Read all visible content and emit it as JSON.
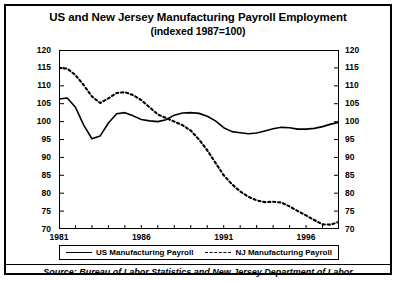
{
  "chart_data": {
    "type": "line",
    "title": "US and New Jersey Manufacturing Payroll Employment",
    "subtitle": "(indexed 1987=100)",
    "xlabel": "",
    "ylabel": "",
    "ylim": [
      70,
      120
    ],
    "ytick_step": 5,
    "yticks": [
      70,
      75,
      80,
      85,
      90,
      95,
      100,
      105,
      110,
      115,
      120
    ],
    "xlim": [
      1981,
      1998
    ],
    "xticks_labeled": [
      1981,
      1986,
      1991,
      1996
    ],
    "xticks_minor": [
      1982,
      1983,
      1984,
      1985,
      1987,
      1988,
      1989,
      1990,
      1992,
      1993,
      1994,
      1995,
      1997,
      1998
    ],
    "grid": false,
    "legend_position": "below-plot",
    "dual_y_axis": true,
    "x": [
      1981.0,
      1981.5,
      1982.0,
      1982.5,
      1983.0,
      1983.5,
      1984.0,
      1984.5,
      1985.0,
      1985.5,
      1986.0,
      1986.5,
      1987.0,
      1987.5,
      1988.0,
      1988.5,
      1989.0,
      1989.5,
      1990.0,
      1990.5,
      1991.0,
      1991.5,
      1992.0,
      1992.5,
      1993.0,
      1993.5,
      1994.0,
      1994.5,
      1995.0,
      1995.5,
      1996.0,
      1996.5,
      1997.0,
      1997.5,
      1998.0
    ],
    "series": [
      {
        "name": "US Manufacturing Payroll",
        "style": "solid",
        "color": "#000000",
        "values": [
          106.3,
          106.6,
          104.0,
          99.0,
          95.2,
          96.0,
          99.6,
          102.2,
          102.5,
          101.6,
          100.6,
          100.2,
          100.0,
          100.5,
          101.8,
          102.4,
          102.5,
          102.3,
          101.5,
          100.2,
          98.3,
          97.2,
          96.9,
          96.6,
          96.8,
          97.4,
          98.0,
          98.4,
          98.3,
          97.9,
          97.9,
          98.1,
          98.6,
          99.3,
          99.8
        ]
      },
      {
        "name": "NJ Manufacturing Payroll",
        "style": "dashed",
        "color": "#000000",
        "values": [
          115.0,
          114.8,
          113.0,
          110.2,
          107.0,
          105.2,
          106.5,
          108.0,
          108.2,
          107.4,
          106.0,
          104.0,
          102.0,
          101.0,
          100.0,
          99.0,
          97.5,
          95.0,
          92.0,
          88.5,
          85.0,
          82.5,
          80.5,
          79.0,
          78.0,
          77.5,
          77.6,
          77.4,
          76.3,
          75.0,
          73.8,
          72.5,
          71.3,
          71.2,
          72.0
        ]
      }
    ],
    "legend": [
      {
        "label": "US Manufacturing Payroll",
        "style": "solid"
      },
      {
        "label": "NJ Manufacturing Payroll",
        "style": "dashed"
      }
    ],
    "source": "Source:  Bureau of Labor Statistics and New Jersey Department of Labor"
  }
}
